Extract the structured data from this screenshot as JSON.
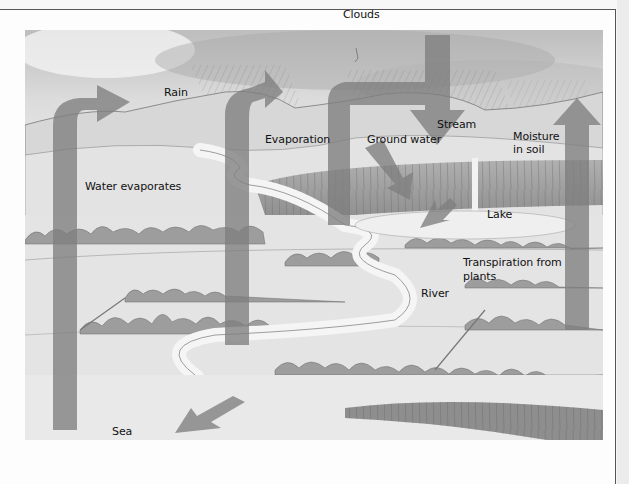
{
  "diagram": {
    "labels": {
      "clouds": "Clouds",
      "rain": "Rain",
      "evaporation": "Evaporation",
      "ground_water": "Ground water",
      "stream": "Stream",
      "moisture_in_soil_line1": "Moisture",
      "moisture_in_soil_line2": "in soil",
      "water_evaporates": "Water evaporates",
      "lake": "Lake",
      "transpiration_line1": "Transpiration from",
      "transpiration_line2": "plants",
      "river": "River",
      "sea": "Sea"
    },
    "arrows": [
      {
        "id": "sea-evaporation",
        "direction": "up-right"
      },
      {
        "id": "evaporation-column",
        "direction": "up-right"
      },
      {
        "id": "cloud-to-rain",
        "direction": "down"
      },
      {
        "id": "ground-water-flow",
        "direction": "down-right"
      },
      {
        "id": "stream-to-lake",
        "direction": "down-left"
      },
      {
        "id": "river-to-sea",
        "direction": "down-left"
      },
      {
        "id": "transpiration-up",
        "direction": "up"
      }
    ],
    "colors": {
      "arrow": "#8a8a8a",
      "sky": "#d9d9d9",
      "land": "#e6e6e6",
      "cliff": "#9a9a9a",
      "border": "#555555"
    }
  }
}
